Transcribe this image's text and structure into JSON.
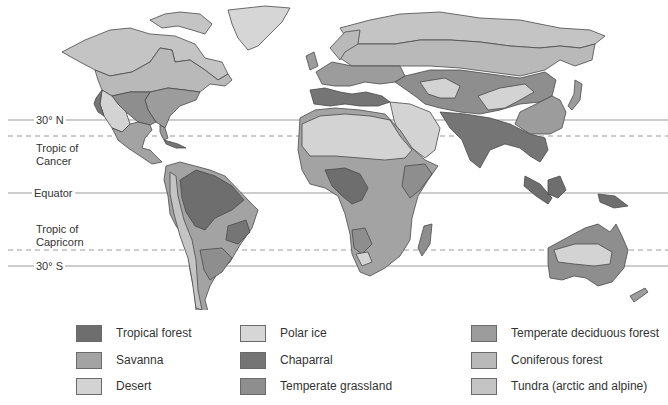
{
  "latitude_lines": [
    {
      "label": "30° N",
      "y": 120,
      "style": "solid"
    },
    {
      "label": "Tropic of Cancer",
      "line1": "Tropic of",
      "line2": "Cancer",
      "y": 136,
      "style": "dashed"
    },
    {
      "label": "Equator",
      "y": 193,
      "style": "solid"
    },
    {
      "label": "Tropic of Capricorn",
      "line1": "Tropic of",
      "line2": "Capricorn",
      "y": 250,
      "style": "dashed"
    },
    {
      "label": "30° S",
      "y": 266,
      "style": "solid"
    }
  ],
  "labels": {
    "n30": "30° N",
    "cancer1": "Tropic of",
    "cancer2": "Cancer",
    "equator": "Equator",
    "capricorn1": "Tropic of",
    "capricorn2": "Capricorn",
    "s30": "30° S"
  },
  "colors": {
    "tropical_forest": "#6e6e6e",
    "savanna": "#a3a3a3",
    "desert": "#d3d3d3",
    "polar_ice": "#d6d6d6",
    "chaparral": "#757575",
    "temperate_grassland": "#8e8e8e",
    "temperate_deciduous_forest": "#9c9c9c",
    "coniferous_forest": "#b9b9b9",
    "tundra": "#c4c4c4",
    "outline": "#4a4a4a",
    "lat_line": "#9a9a9a"
  },
  "legend": {
    "items": [
      {
        "label": "Tropical forest",
        "color": "#6e6e6e"
      },
      {
        "label": "Savanna",
        "color": "#a3a3a3"
      },
      {
        "label": "Desert",
        "color": "#d3d3d3"
      },
      {
        "label": "Polar ice",
        "color": "#d6d6d6"
      },
      {
        "label": "Chaparral",
        "color": "#757575"
      },
      {
        "label": "Temperate grassland",
        "color": "#8e8e8e"
      },
      {
        "label": "Temperate deciduous forest",
        "color": "#9c9c9c"
      },
      {
        "label": "Coniferous forest",
        "color": "#b9b9b9"
      },
      {
        "label": "Tundra (arctic and alpine)",
        "color": "#c4c4c4"
      }
    ]
  }
}
